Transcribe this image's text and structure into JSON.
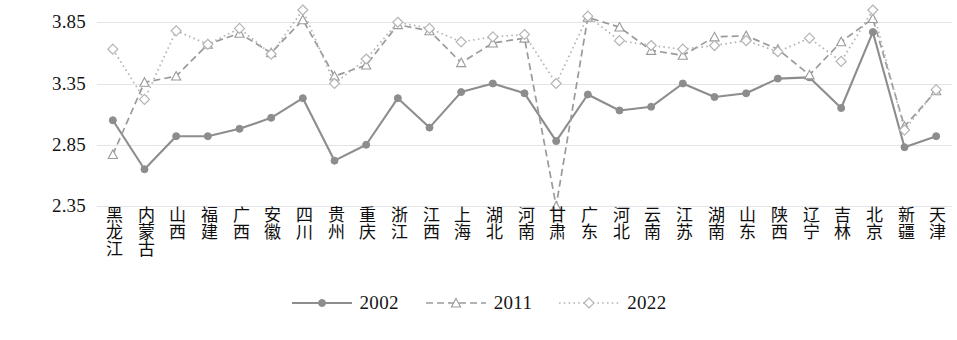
{
  "chart_data": {
    "type": "line",
    "title": "",
    "xlabel": "",
    "ylabel": "",
    "ylim": [
      2.35,
      3.95
    ],
    "yticks": [
      "2.35",
      "2.85",
      "3.35",
      "3.85"
    ],
    "grid": true,
    "legend_position": "bottom-center",
    "categories": [
      "黑龙江",
      "内蒙古",
      "山西",
      "福建",
      "广西",
      "安徽",
      "四川",
      "贵州",
      "重庆",
      "浙江",
      "江西",
      "上海",
      "湖北",
      "河南",
      "甘肃",
      "广东",
      "河北",
      "云南",
      "江苏",
      "湖南",
      "山东",
      "陕西",
      "辽宁",
      "吉林",
      "北京",
      "新疆",
      "天津"
    ],
    "series": [
      {
        "name": "2002",
        "color": "#8d8d8d",
        "dash": "solid",
        "marker": "circle-filled",
        "values": [
          3.05,
          2.65,
          2.92,
          2.92,
          2.98,
          3.07,
          3.23,
          2.72,
          2.85,
          3.23,
          2.99,
          3.28,
          3.35,
          3.27,
          2.88,
          3.26,
          3.13,
          3.16,
          3.35,
          3.24,
          3.27,
          3.39,
          3.4,
          3.15,
          3.77,
          2.83,
          2.92
        ]
      },
      {
        "name": "2011",
        "color": "#9a9a9a",
        "dash": "dashed",
        "marker": "triangle-open",
        "values": [
          2.77,
          3.36,
          3.41,
          3.67,
          3.76,
          3.6,
          3.87,
          3.41,
          3.5,
          3.83,
          3.78,
          3.52,
          3.68,
          3.72,
          2.35,
          3.89,
          3.81,
          3.62,
          3.58,
          3.73,
          3.74,
          3.63,
          3.42,
          3.69,
          3.88,
          3.0,
          3.29
        ]
      },
      {
        "name": "2022",
        "color": "#b4b4b4",
        "dash": "dotted",
        "marker": "diamond-open",
        "values": [
          3.63,
          3.22,
          3.78,
          3.67,
          3.8,
          3.59,
          3.95,
          3.35,
          3.55,
          3.85,
          3.8,
          3.69,
          3.73,
          3.75,
          3.35,
          3.9,
          3.7,
          3.66,
          3.63,
          3.66,
          3.7,
          3.61,
          3.72,
          3.53,
          3.95,
          2.97,
          3.3
        ]
      }
    ]
  },
  "legend": {
    "items": [
      {
        "label": "2002"
      },
      {
        "label": "2011"
      },
      {
        "label": "2022"
      }
    ]
  }
}
